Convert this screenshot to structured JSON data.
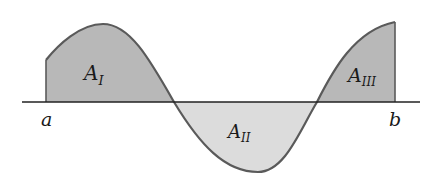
{
  "diagram": {
    "title": "",
    "labels": {
      "a": "a",
      "b": "b",
      "region1": {
        "main": "A",
        "sub": "I"
      },
      "region2": {
        "main": "A",
        "sub": "II"
      },
      "region3": {
        "main": "A",
        "sub": "III"
      }
    },
    "colors": {
      "positive_fill": "#b8b8b8",
      "negative_fill": "#dcdcdc",
      "curve": "#5a5a5a",
      "axis": "#222222"
    }
  }
}
